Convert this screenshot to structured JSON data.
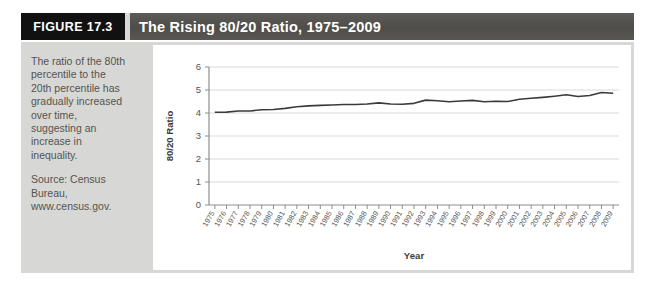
{
  "figure": {
    "number_label": "FIGURE 17.3",
    "title": "The Rising 80/20 Ratio, 1975–2009",
    "caption": "The ratio of the 80th percentile to the 20th percentile has gradually increased over time, suggesting an increase in inequality.",
    "source": "Source: Census Bureau, www.census.gov."
  },
  "colors": {
    "figure_number_background": "#111111",
    "title_bar_background": "#54534f",
    "panel_background": "#d7d7d5",
    "plot_background": "#ffffff",
    "line_color": "#3a3a3a",
    "grid_color": "#d9d9d9",
    "text_color": "#55544f"
  },
  "chart_data": {
    "type": "line",
    "title": "The Rising 80/20 Ratio, 1975–2009",
    "xlabel": "Year",
    "ylabel": "80/20 Ratio",
    "ylim": [
      0,
      6
    ],
    "ytick_labels": [
      "0",
      "1",
      "2",
      "3",
      "4",
      "5",
      "6"
    ],
    "yticks": [
      0,
      1,
      2,
      3,
      4,
      5,
      6
    ],
    "grid": true,
    "legend": "none",
    "categories": [
      "1975",
      "1976",
      "1977",
      "1978",
      "1979",
      "1980",
      "1981",
      "1982",
      "1983",
      "1984",
      "1985",
      "1986",
      "1987",
      "1988",
      "1989",
      "1990",
      "1991",
      "1992",
      "1993",
      "1994",
      "1995",
      "1996",
      "1997",
      "1998",
      "1999",
      "2000",
      "2001",
      "2002",
      "2003",
      "2004",
      "2005",
      "2006",
      "2007",
      "2008",
      "2009"
    ],
    "series": [
      {
        "name": "80/20 Ratio",
        "values": [
          4.03,
          4.04,
          4.09,
          4.09,
          4.14,
          4.15,
          4.2,
          4.27,
          4.31,
          4.33,
          4.35,
          4.37,
          4.37,
          4.39,
          4.44,
          4.39,
          4.38,
          4.42,
          4.56,
          4.53,
          4.49,
          4.52,
          4.55,
          4.49,
          4.51,
          4.5,
          4.6,
          4.64,
          4.68,
          4.73,
          4.79,
          4.72,
          4.76,
          4.89,
          4.86
        ]
      }
    ]
  }
}
